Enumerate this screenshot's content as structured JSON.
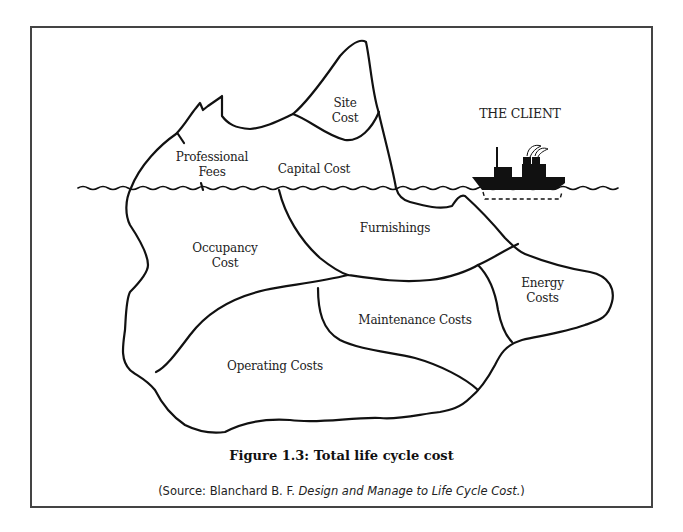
{
  "figure": {
    "caption": "Figure 1.3: Total life cycle cost",
    "source_prefix": "(Source: Blanchard B. F. ",
    "source_title": "Design and Manage to Life Cycle Cost.",
    "source_suffix": ")"
  },
  "iceberg": {
    "above_water": [
      {
        "id": "site-cost",
        "line1": "Site",
        "line2": "Cost"
      },
      {
        "id": "professional-fees",
        "line1": "Professional",
        "line2": "Fees"
      },
      {
        "id": "capital-cost",
        "line1": "Capital Cost"
      }
    ],
    "below_water": [
      {
        "id": "occupancy-cost",
        "line1": "Occupancy",
        "line2": "Cost"
      },
      {
        "id": "furnishings",
        "line1": "Furnishings"
      },
      {
        "id": "energy-costs",
        "line1": "Energy",
        "line2": "Costs"
      },
      {
        "id": "maintenance-costs",
        "line1": "Maintenance Costs"
      },
      {
        "id": "operating-costs",
        "line1": "Operating Costs"
      }
    ]
  },
  "ship": {
    "label": "THE CLIENT"
  },
  "colors": {
    "ink": "#111111",
    "frame": "#444444",
    "background": "#ffffff"
  }
}
